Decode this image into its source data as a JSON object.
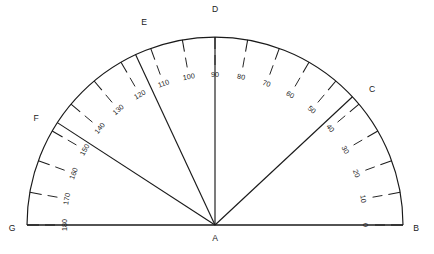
{
  "figure": {
    "type": "geometry-diagram",
    "stroke_color": "#1a1a1a",
    "background_color": "#ffffff"
  },
  "geometry": {
    "center": {
      "x": 215,
      "y": 225,
      "label": "A"
    },
    "radius": 188,
    "baseline": {
      "left_x": 27,
      "right_x": 403,
      "y": 225
    },
    "arc_start_deg": 0,
    "arc_end_deg": 180
  },
  "points": [
    {
      "label": "B",
      "angle_deg": 0,
      "lx": 416,
      "ly": 231,
      "on_arc": true
    },
    {
      "label": "C",
      "angle_deg": 43,
      "lx": 372,
      "ly": 92,
      "on_arc": true
    },
    {
      "label": "D",
      "angle_deg": 90,
      "lx": 215,
      "ly": 12,
      "on_arc": true
    },
    {
      "label": "E",
      "angle_deg": 115,
      "lx": 144,
      "ly": 25,
      "on_arc": true
    },
    {
      "label": "F",
      "angle_deg": 147,
      "lx": 36,
      "ly": 121,
      "on_arc": true
    },
    {
      "label": "G",
      "angle_deg": 180,
      "lx": 12,
      "ly": 231,
      "on_arc": true
    }
  ],
  "rays": [
    {
      "from": "A",
      "to": "B",
      "angle_deg": 0
    },
    {
      "from": "A",
      "to": "C",
      "angle_deg": 43
    },
    {
      "from": "A",
      "to": "D",
      "angle_deg": 90
    },
    {
      "from": "A",
      "to": "E",
      "angle_deg": 115
    },
    {
      "from": "A",
      "to": "F",
      "angle_deg": 147
    },
    {
      "from": "A",
      "to": "G",
      "angle_deg": 180
    }
  ],
  "scale": {
    "step_deg": 10,
    "labels": [
      "0",
      "10",
      "20",
      "30",
      "40",
      "50",
      "60",
      "70",
      "80",
      "90",
      "100",
      "110",
      "120",
      "130",
      "140",
      "150",
      "160",
      "170",
      "180"
    ],
    "values": [
      0,
      10,
      20,
      30,
      40,
      50,
      60,
      70,
      80,
      90,
      100,
      110,
      120,
      130,
      140,
      150,
      160,
      170,
      180
    ],
    "label_radius": 150,
    "tick_outer_radius": 188,
    "tick_inner_radius": 176,
    "inner_tick_outer_radius": 170,
    "inner_tick_inner_radius": 160
  }
}
